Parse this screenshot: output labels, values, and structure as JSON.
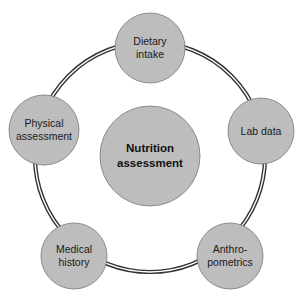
{
  "diagram": {
    "center": {
      "label_lines": [
        "Nutrition",
        "assessment"
      ],
      "cx": 150,
      "cy": 156,
      "r": 50
    },
    "ring": {
      "cx": 150,
      "cy": 157,
      "r": 115,
      "stroke": "#333333"
    },
    "nodes": [
      {
        "id": "dietary-intake",
        "label_lines": [
          "Dietary",
          "intake"
        ],
        "cx": 150,
        "cy": 48,
        "r": 35
      },
      {
        "id": "lab-data",
        "label_lines": [
          "Lab data"
        ],
        "cx": 261,
        "cy": 131,
        "r": 33
      },
      {
        "id": "anthropometrics",
        "label_lines": [
          "Anthro-",
          "pometrics"
        ],
        "cx": 230,
        "cy": 256,
        "r": 33
      },
      {
        "id": "medical-history",
        "label_lines": [
          "Medical",
          "history"
        ],
        "cx": 74,
        "cy": 256,
        "r": 33
      },
      {
        "id": "physical-assessment",
        "label_lines": [
          "Physical",
          "assessment"
        ],
        "cx": 44,
        "cy": 130,
        "r": 35
      }
    ],
    "colors": {
      "fill": "#bdbdbd",
      "outline": "#777777",
      "text": "#1a1a1a",
      "background": "#ffffff"
    }
  }
}
